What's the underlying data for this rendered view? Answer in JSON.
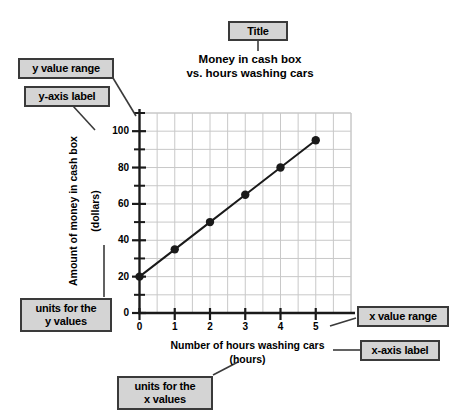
{
  "chart_data": {
    "type": "line",
    "title": "Money in cash box vs. hours washing cars",
    "title_line1": "Money in cash box",
    "title_line2": "vs. hours washing cars",
    "xlabel": "Number of hours washing cars",
    "xunits": "(hours)",
    "ylabel": "Amount of money in cash box",
    "yunits": "(dollars)",
    "x": [
      0,
      1,
      2,
      3,
      4,
      5
    ],
    "values": [
      20,
      35,
      50,
      65,
      80,
      95
    ],
    "xlim": [
      0,
      6
    ],
    "ylim": [
      0,
      110
    ],
    "x_ticks": [
      "0",
      "1",
      "2",
      "3",
      "4",
      "5"
    ],
    "y_ticks": [
      "0",
      "20",
      "40",
      "60",
      "80",
      "100"
    ],
    "y_minor_step": 10,
    "grid": true,
    "legend": "none",
    "marker": "filled-circle",
    "line_color": "#1a1a1a",
    "grid_color": "#c8c8c8",
    "axis_color": "#1a1a1a"
  },
  "callouts": [
    {
      "id": "title",
      "label": "Title"
    },
    {
      "id": "y-value-range",
      "label": "y value range"
    },
    {
      "id": "y-axis-label",
      "label": "y-axis label"
    },
    {
      "id": "units-y",
      "label": "units for the\ny values",
      "line1": "units for the",
      "line2": "y values"
    },
    {
      "id": "x-value-range",
      "label": "x value range"
    },
    {
      "id": "x-axis-label",
      "label": "x-axis label"
    },
    {
      "id": "units-x",
      "label": "units for the\nx values",
      "line1": "units for the",
      "line2": "x values"
    }
  ],
  "colors": {
    "callout_fill": "#d4d4d4",
    "callout_border": "#3a3a3a",
    "plot_background": "#ffffff",
    "page_background": "#ffffff"
  }
}
